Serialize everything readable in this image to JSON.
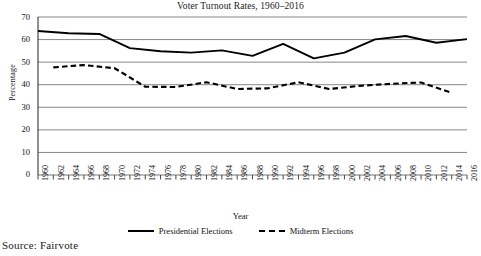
{
  "chart_data": {
    "type": "line",
    "title": "Voter Turnout Rates, 1960–2016",
    "xlabel": "Year",
    "ylabel": "Percentage",
    "ylim": [
      0,
      70
    ],
    "yticks": [
      0,
      10,
      20,
      30,
      40,
      50,
      60,
      70
    ],
    "grid": true,
    "legend_position": "bottom",
    "x": [
      1960,
      1962,
      1964,
      1966,
      1968,
      1970,
      1972,
      1974,
      1976,
      1978,
      1980,
      1982,
      1984,
      1986,
      1988,
      1990,
      1992,
      1994,
      1996,
      1998,
      2000,
      2002,
      2004,
      2006,
      2008,
      2010,
      2012,
      2014,
      2016
    ],
    "categories": [
      "1960",
      "1962",
      "1964",
      "1966",
      "1968",
      "1970",
      "1972",
      "1974",
      "1976",
      "1978",
      "1980",
      "1982",
      "1984",
      "1986",
      "1988",
      "1990",
      "1992",
      "1994",
      "1996",
      "1998",
      "2000",
      "2002",
      "2004",
      "2006",
      "2008",
      "2010",
      "2012",
      "2014",
      "2016"
    ],
    "series": [
      {
        "name": "Presidential Elections",
        "style": "solid",
        "color": "#000000",
        "x": [
          1960,
          1964,
          1968,
          1972,
          1976,
          1980,
          1984,
          1988,
          1992,
          1996,
          2000,
          2004,
          2008,
          2012,
          2016
        ],
        "values": [
          63.8,
          62.8,
          62.5,
          56.2,
          54.8,
          54.2,
          55.2,
          52.8,
          58.1,
          51.7,
          54.2,
          60.1,
          61.6,
          58.6,
          60.2
        ]
      },
      {
        "name": "Midterm Elections",
        "style": "dashed",
        "color": "#000000",
        "x": [
          1962,
          1966,
          1970,
          1974,
          1978,
          1982,
          1986,
          1990,
          1994,
          1998,
          2002,
          2006,
          2010,
          2014
        ],
        "values": [
          47.7,
          48.7,
          47.3,
          39.1,
          39.0,
          41.1,
          38.1,
          38.4,
          41.1,
          38.1,
          39.5,
          40.4,
          41.0,
          36.4
        ]
      }
    ],
    "annotations": []
  },
  "chart": {
    "title": "Voter Turnout Rates, 1960–2016",
    "y_axis_title": "Percentage",
    "x_axis_title": "Year",
    "y_tick_labels": [
      "70",
      "60",
      "50",
      "40",
      "30",
      "20",
      "10",
      "0"
    ],
    "x_tick_labels": [
      "1960",
      "1962",
      "1964",
      "1966",
      "1968",
      "1970",
      "1972",
      "1974",
      "1976",
      "1978",
      "1980",
      "1982",
      "1984",
      "1986",
      "1988",
      "1990",
      "1992",
      "1994",
      "1996",
      "1998",
      "2000",
      "2002",
      "2004",
      "2006",
      "2008",
      "2010",
      "2012",
      "2014",
      "2016"
    ],
    "legend": [
      {
        "label": "Presidential Elections",
        "style": "solid"
      },
      {
        "label": "Midterm Elections",
        "style": "dashed"
      }
    ]
  },
  "source": {
    "text": "Source: Fairvote"
  },
  "colors": {
    "line": "#000000",
    "grid": "#7a7a7a",
    "background": "#ffffff",
    "text": "#111111"
  }
}
